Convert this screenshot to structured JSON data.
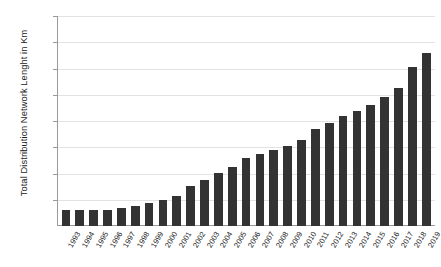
{
  "chart_data": {
    "type": "bar",
    "title": "",
    "xlabel": "",
    "ylabel": "Total Distribution Network Lenght in Km",
    "ylim": [
      0,
      4000
    ],
    "ytick_labels": [
      "500",
      "1000",
      "1500",
      "2000",
      "2500",
      "3000",
      "3500",
      "4000"
    ],
    "ytick_values": [
      500,
      1000,
      1500,
      2000,
      2500,
      3000,
      3500,
      4000
    ],
    "grid": true,
    "legend": "none",
    "bar_color": "#333333",
    "gridline_color": "#e2e2e2",
    "axis_color": "#9a9a9a",
    "categories": [
      "1993",
      "1994",
      "1995",
      "1996",
      "1997",
      "1998",
      "1999",
      "2000",
      "2001",
      "2002",
      "2003",
      "2004",
      "2005",
      "2006",
      "2007",
      "2008",
      "2009",
      "2010",
      "2011",
      "2012",
      "2013",
      "2014",
      "2015",
      "2016",
      "2017",
      "2018",
      "2019"
    ],
    "values": [
      300,
      300,
      305,
      310,
      350,
      390,
      430,
      490,
      580,
      760,
      870,
      1010,
      1130,
      1300,
      1380,
      1450,
      1530,
      1640,
      1840,
      1970,
      2090,
      2200,
      2310,
      2450,
      2620,
      3030,
      3290
    ]
  }
}
